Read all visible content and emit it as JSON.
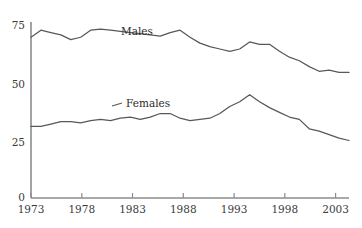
{
  "chart_data": {
    "type": "line",
    "title": "",
    "subtitle": "",
    "xlabel": "",
    "ylabel": "",
    "xlim": [
      1973,
      2005
    ],
    "ylim": [
      0,
      75
    ],
    "grid": false,
    "legend_position": "inline-annotation",
    "y_ticks": [
      "0",
      "25",
      "50",
      "75"
    ],
    "y_tick_values": [
      0,
      25,
      50,
      75
    ],
    "x_ticks": [
      "1973",
      "1978",
      "1983",
      "1988",
      "1993",
      "1998",
      "2003"
    ],
    "x_tick_values": [
      1973,
      1978,
      1983,
      1988,
      1993,
      1998,
      2003
    ],
    "x": [
      1973,
      1974,
      1975,
      1976,
      1977,
      1978,
      1979,
      1980,
      1981,
      1982,
      1983,
      1984,
      1985,
      1986,
      1987,
      1988,
      1989,
      1990,
      1991,
      1992,
      1993,
      1994,
      1995,
      1996,
      1997,
      1998,
      1999,
      2000,
      2001,
      2002,
      2003,
      2004,
      2005
    ],
    "series": [
      {
        "name": "Males",
        "color": "#58585a",
        "label": "Males",
        "values": [
          68.5,
          71.5,
          70.5,
          69.5,
          67.5,
          68.5,
          71.5,
          72.0,
          71.5,
          71.0,
          70.5,
          70.0,
          69.5,
          69.0,
          70.5,
          71.5,
          68.5,
          66.0,
          64.5,
          63.5,
          62.5,
          63.5,
          66.5,
          65.5,
          65.5,
          62.5,
          60.0,
          58.5,
          56.0,
          54.0,
          54.5,
          53.5,
          53.5
        ]
      },
      {
        "name": "Females",
        "color": "#58585a",
        "label": "Females",
        "values": [
          30.5,
          30.5,
          31.5,
          32.5,
          32.5,
          32.0,
          33.0,
          33.5,
          33.0,
          34.0,
          34.5,
          33.5,
          34.5,
          36.0,
          36.0,
          34.0,
          33.0,
          33.5,
          34.0,
          36.0,
          39.0,
          41.0,
          44.0,
          41.0,
          38.5,
          36.5,
          34.5,
          33.5,
          29.5,
          28.5,
          27.0,
          25.5,
          24.5
        ]
      }
    ],
    "annotations": [
      {
        "text": "Males",
        "x": 1982.2,
        "y": 71.5
      },
      {
        "text": "Females",
        "x": 1982.8,
        "y": 42.0
      }
    ]
  },
  "colors": {
    "line": "#58585a",
    "axis": "#8c8c8c",
    "text": "#3b3b3b",
    "background": "#ffffff"
  }
}
